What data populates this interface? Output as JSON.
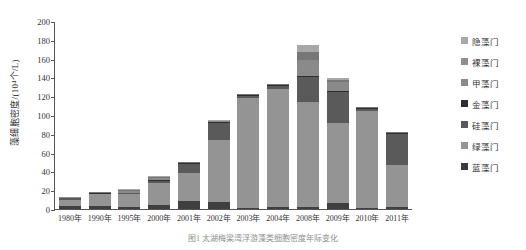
{
  "chart_data": {
    "type": "bar",
    "title": "",
    "caption": "图1  太湖梅梁湾浮游藻类细胞密度年际变化",
    "xlabel": "",
    "ylabel": "藻细胞密度/(10⁴个/L)",
    "ylim": [
      0,
      200
    ],
    "yticks": [
      0,
      20,
      40,
      60,
      80,
      100,
      120,
      140,
      160,
      180,
      200
    ],
    "grid": false,
    "legend_position": "right",
    "stacked": true,
    "categories": [
      "1980年",
      "1990年",
      "1995年",
      "2000年",
      "2001年",
      "2002年",
      "2003年",
      "2004年",
      "2008年",
      "2009年",
      "2010年",
      "2011年"
    ],
    "series": [
      {
        "name": "蓝藻门",
        "color": "#3f3f3f",
        "values": [
          3.0,
          3.5,
          2.5,
          4.0,
          9.0,
          7.0,
          1.5,
          2.0,
          2.0,
          6.0,
          1.5,
          2.0
        ]
      },
      {
        "name": "绿藻门",
        "color": "#949494",
        "values": [
          6.5,
          12.0,
          13.0,
          24.0,
          29.0,
          66.0,
          117.0,
          126.0,
          112.0,
          86.0,
          103.0,
          45.0
        ]
      },
      {
        "name": "硅藻门",
        "color": "#5a5a5a",
        "values": [
          2.0,
          1.0,
          1.5,
          2.0,
          10.0,
          19.0,
          2.0,
          3.0,
          26.0,
          33.0,
          2.0,
          33.0
        ]
      },
      {
        "name": "金藻门",
        "color": "#2e2e2e",
        "values": [
          0.5,
          0.4,
          0.4,
          0.6,
          0.5,
          0.6,
          0.5,
          0.5,
          1.0,
          1.0,
          0.5,
          0.6
        ]
      },
      {
        "name": "甲藻门",
        "color": "#8a8a8a",
        "values": [
          0.4,
          0.4,
          2.0,
          2.0,
          0.8,
          0.8,
          0.6,
          0.6,
          18.0,
          9.0,
          0.6,
          0.6
        ]
      },
      {
        "name": "裸藻门",
        "color": "#777777",
        "values": [
          0.3,
          0.4,
          0.8,
          1.0,
          0.5,
          0.5,
          0.4,
          0.4,
          8.0,
          2.0,
          0.5,
          0.5
        ]
      },
      {
        "name": "隐藻门",
        "color": "#a8a8a8",
        "values": [
          0.3,
          0.3,
          0.8,
          1.4,
          0.2,
          0.6,
          0.5,
          0.5,
          8.0,
          2.0,
          0.4,
          0.3
        ]
      }
    ]
  },
  "legend": {
    "items": [
      {
        "label": "隐藻门",
        "color": "#a8a8a8"
      },
      {
        "label": "裸藻门",
        "color": "#8f8f8f"
      },
      {
        "label": "甲藻门",
        "color": "#8a8a8a"
      },
      {
        "label": "金藻门",
        "color": "#2e2e2e"
      },
      {
        "label": "硅藻门",
        "color": "#5a5a5a"
      },
      {
        "label": "绿藻门",
        "color": "#949494"
      },
      {
        "label": "蓝藻门",
        "color": "#3a3a3a"
      }
    ]
  }
}
